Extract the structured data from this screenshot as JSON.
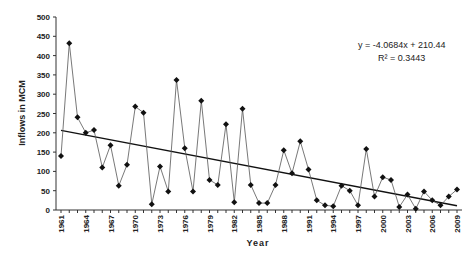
{
  "chart_data": {
    "type": "line",
    "title": "",
    "xlabel": "Year",
    "ylabel": "Inflows in MCM",
    "ylim": [
      0,
      500
    ],
    "xlim": [
      1961,
      2009
    ],
    "grid": false,
    "legend": "none",
    "y_ticks": [
      0,
      50,
      100,
      150,
      200,
      250,
      300,
      350,
      400,
      450,
      500
    ],
    "x_tick_labels": [
      "1961",
      "1964",
      "1967",
      "1970",
      "1973",
      "1976",
      "1979",
      "1982",
      "1985",
      "1988",
      "1991",
      "1994",
      "1997",
      "2000",
      "2003",
      "2006",
      "2009"
    ],
    "x": [
      1961,
      1962,
      1963,
      1964,
      1965,
      1966,
      1967,
      1968,
      1969,
      1970,
      1971,
      1972,
      1973,
      1974,
      1975,
      1976,
      1977,
      1978,
      1979,
      1980,
      1981,
      1982,
      1983,
      1984,
      1985,
      1986,
      1987,
      1988,
      1989,
      1990,
      1991,
      1992,
      1993,
      1994,
      1995,
      1996,
      1997,
      1998,
      1999,
      2000,
      2001,
      2002,
      2003,
      2004,
      2005,
      2006,
      2007,
      2008,
      2009
    ],
    "series": [
      {
        "name": "Inflows",
        "marker": "diamond",
        "values": [
          140,
          432,
          240,
          200,
          207,
          110,
          168,
          63,
          117,
          268,
          252,
          15,
          113,
          48,
          337,
          160,
          48,
          283,
          78,
          65,
          222,
          20,
          262,
          65,
          18,
          18,
          65,
          155,
          95,
          178,
          105,
          25,
          12,
          10,
          63,
          50,
          12,
          158,
          35,
          85,
          78,
          8,
          40,
          3,
          48,
          25,
          12,
          35,
          53
        ]
      }
    ],
    "trendline": {
      "type": "linear",
      "slope": -4.0684,
      "intercept": 210.44,
      "r_squared": 0.3443
    },
    "annotations": [
      "y = -4.0684x + 210.44",
      "R² = 0.3443"
    ]
  },
  "labels": {
    "equation": "y = -4.0684x + 210.44",
    "r2": "R² = 0.3443",
    "xlabel": "Year",
    "ylabel": "Inflows in MCM"
  }
}
